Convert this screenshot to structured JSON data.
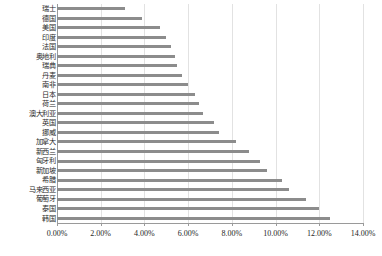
{
  "chart_data": {
    "type": "bar",
    "orientation": "horizontal",
    "title": "",
    "subtitle": "",
    "xlabel": "",
    "ylabel": "",
    "xlim": [
      0,
      14
    ],
    "xunit": "%",
    "xticks": [
      0,
      2,
      4,
      6,
      8,
      10,
      12,
      14
    ],
    "xtick_labels": [
      "0.00%",
      "2.00%",
      "4.00%",
      "6.00%",
      "8.00%",
      "10.00%",
      "12.00%",
      "14.00%"
    ],
    "grid": true,
    "grid_axis": "x",
    "legend": null,
    "bar_color": "#8c8c8c",
    "categories": [
      "瑞士",
      "德国",
      "美国",
      "印度",
      "法国",
      "奥地利",
      "瑞典",
      "丹麦",
      "南非",
      "日本",
      "荷兰",
      "澳大利亚",
      "英国",
      "挪威",
      "加拿大",
      "新西兰",
      "匈牙利",
      "新加坡",
      "希腊",
      "马来西亚",
      "葡萄牙",
      "泰国",
      "韩国"
    ],
    "values": [
      3.1,
      3.9,
      4.7,
      5.0,
      5.2,
      5.4,
      5.5,
      5.7,
      6.0,
      6.3,
      6.5,
      6.7,
      7.2,
      7.4,
      8.2,
      8.8,
      9.3,
      9.6,
      10.3,
      10.6,
      11.4,
      12.0,
      12.5
    ],
    "series": [
      {
        "name": "",
        "values": [
          3.1,
          3.9,
          4.7,
          5.0,
          5.2,
          5.4,
          5.5,
          5.7,
          6.0,
          6.3,
          6.5,
          6.7,
          7.2,
          7.4,
          8.2,
          8.8,
          9.3,
          9.6,
          10.3,
          10.6,
          11.4,
          12.0,
          12.5
        ]
      }
    ]
  }
}
